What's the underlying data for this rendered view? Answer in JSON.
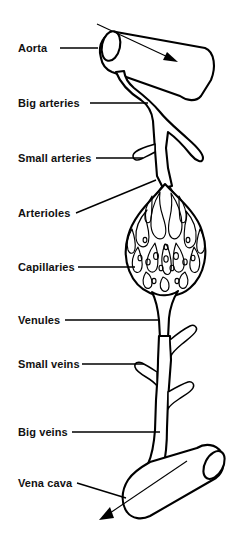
{
  "figure": {
    "width": 239,
    "height": 537,
    "background_color": "#ffffff",
    "ink_color": "#000000"
  },
  "labels": [
    {
      "id": "aorta",
      "text": "Aorta",
      "text_x": 18,
      "text_y": 52,
      "leader": {
        "x1": 60,
        "y1": 48,
        "x2": 98,
        "y2": 48
      }
    },
    {
      "id": "big-arteries",
      "text": "Big arteries",
      "text_x": 18,
      "text_y": 107,
      "leader": {
        "x1": 90,
        "y1": 103,
        "x2": 148,
        "y2": 103
      }
    },
    {
      "id": "small-arteries",
      "text": "Small arteries",
      "text_x": 18,
      "text_y": 162,
      "leader": {
        "x1": 96,
        "y1": 158,
        "x2": 143,
        "y2": 158
      }
    },
    {
      "id": "arterioles",
      "text": "Arterioles",
      "text_x": 18,
      "text_y": 217,
      "leader": {
        "x1": 76,
        "y1": 213,
        "x2": 156,
        "y2": 180
      }
    },
    {
      "id": "capillaries",
      "text": "Capillaries",
      "text_x": 18,
      "text_y": 271,
      "leader": {
        "x1": 78,
        "y1": 267,
        "x2": 135,
        "y2": 267
      }
    },
    {
      "id": "venules",
      "text": "Venules",
      "text_x": 18,
      "text_y": 324,
      "leader": {
        "x1": 65,
        "y1": 320,
        "x2": 158,
        "y2": 320
      }
    },
    {
      "id": "small-veins",
      "text": "Small veins",
      "text_x": 18,
      "text_y": 368,
      "leader": {
        "x1": 82,
        "y1": 364,
        "x2": 144,
        "y2": 364
      }
    },
    {
      "id": "big-veins",
      "text": "Big veins",
      "text_x": 18,
      "text_y": 436,
      "leader": {
        "x1": 72,
        "y1": 432,
        "x2": 160,
        "y2": 432
      }
    },
    {
      "id": "vena-cava",
      "text": "Vena cava",
      "text_x": 18,
      "text_y": 487,
      "leader": {
        "x1": 77,
        "y1": 483,
        "x2": 126,
        "y2": 498
      }
    }
  ],
  "flow_arrows": [
    {
      "id": "aorta-flow-arrow",
      "direction": "down-right",
      "from_x": 97,
      "from_y": 24,
      "to_x": 176,
      "to_y": 62
    },
    {
      "id": "vena-cava-flow-arrow",
      "direction": "down-left",
      "from_x": 187,
      "from_y": 461,
      "to_x": 101,
      "to_y": 518
    }
  ],
  "vessels": [
    {
      "id": "aorta-tube",
      "name": "Aorta",
      "shape": "open-ended cylinder tilted up to the right"
    },
    {
      "id": "big-artery-trunk",
      "name": "Big arteries",
      "shape": "thick vertical trunk with one large side branch"
    },
    {
      "id": "small-artery",
      "name": "Small arteries",
      "shape": "narrow branch angled up-left from the trunk"
    },
    {
      "id": "arteriole-fan",
      "name": "Arterioles",
      "shape": "fan of fine vessels entering the capillary bed"
    },
    {
      "id": "capillary-bed",
      "name": "Capillaries",
      "shape": "teardrop mesh of tangled fine vessels"
    },
    {
      "id": "venule-stem",
      "name": "Venules",
      "shape": "converging stem leaving the capillary bed"
    },
    {
      "id": "small-vein",
      "name": "Small veins",
      "shape": "narrow branch angled up-left from the vein trunk"
    },
    {
      "id": "big-vein-trunk",
      "name": "Big veins",
      "shape": "thick vertical trunk with side branches"
    },
    {
      "id": "vena-cava-tube",
      "name": "Vena cava",
      "shape": "open-ended cylinder tilted down to the left"
    }
  ]
}
